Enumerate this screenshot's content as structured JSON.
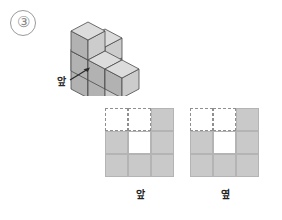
{
  "problem": {
    "number": "③"
  },
  "stack": {
    "front_label": "앞",
    "arrow_icon": "arrow-up-right-icon",
    "cube_fill": "#cccccc",
    "cube_top_fill": "#dcdcdc",
    "cube_side_fill": "#b2b2b2",
    "cube_stroke": "#4a4a4a",
    "cube_count": 10,
    "columns": [
      {
        "col": 0,
        "row": 0,
        "height": 2
      },
      {
        "col": 1,
        "row": 0,
        "height": 1
      },
      {
        "col": 2,
        "row": 0,
        "height": 1
      },
      {
        "col": 1,
        "row": 1,
        "height": 2
      },
      {
        "col": 2,
        "row": 1,
        "height": 3
      }
    ]
  },
  "views": {
    "grid_size": 3,
    "filled_color": "#c9c9c9",
    "empty_color": "#ffffff",
    "border_color": "#b4b4b4",
    "dashed_color": "#8f8f8f",
    "front": {
      "label": "앞",
      "name": "front-view",
      "cells": [
        [
          "empty",
          "empty",
          "filled"
        ],
        [
          "filled",
          "blank",
          "filled"
        ],
        [
          "filled",
          "filled",
          "filled"
        ]
      ]
    },
    "side": {
      "label": "옆",
      "name": "side-view",
      "cells": [
        [
          "empty",
          "empty",
          "filled"
        ],
        [
          "filled",
          "blank",
          "filled"
        ],
        [
          "filled",
          "filled",
          "filled"
        ]
      ]
    }
  }
}
